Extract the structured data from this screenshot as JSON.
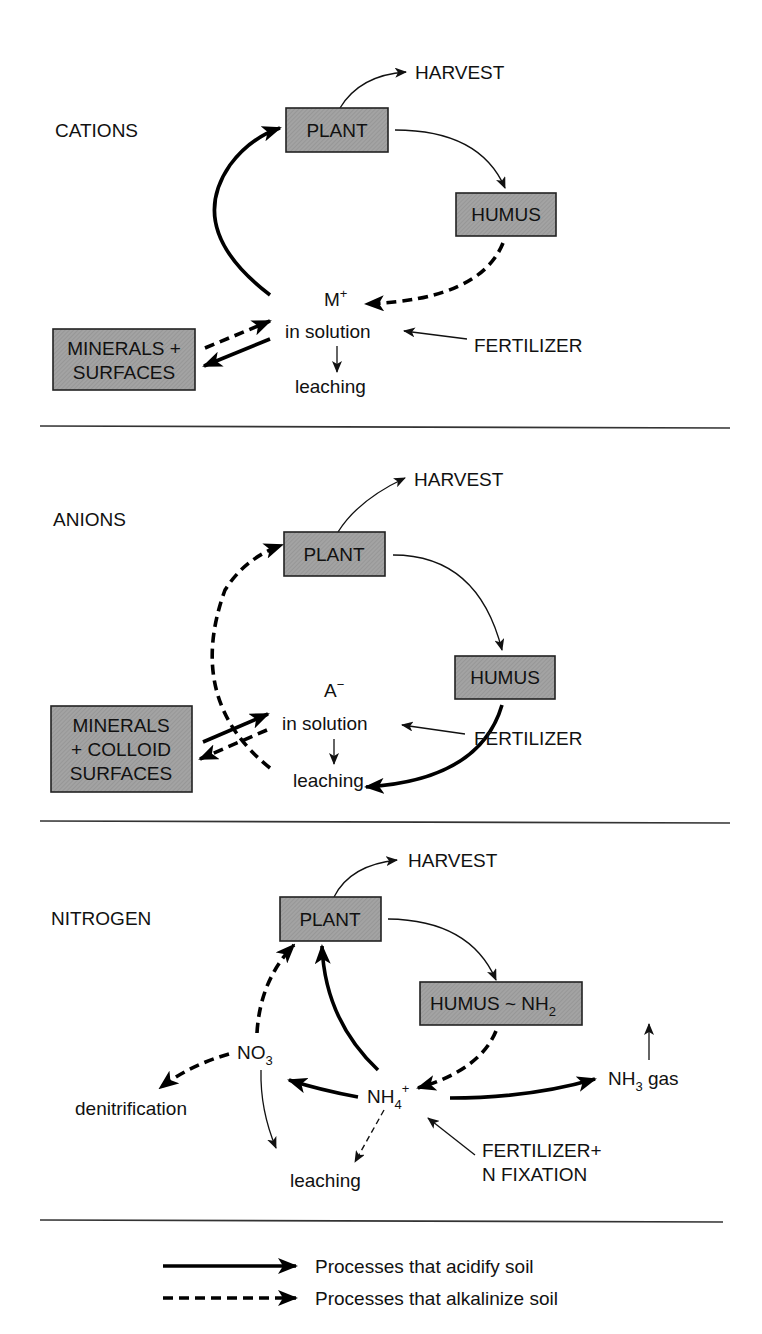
{
  "colors": {
    "box_fill": "#9a9a9a",
    "ink": "#111111",
    "background": "#ffffff"
  },
  "sections": {
    "cations": {
      "title": "CATIONS",
      "harvest": "HARVEST",
      "plant": "PLANT",
      "humus": "HUMUS",
      "ion": "M",
      "ion_charge": "+",
      "in_solution": "in solution",
      "fertilizer": "FERTILIZER",
      "leaching": "leaching",
      "minerals_line1": "MINERALS +",
      "minerals_line2": "SURFACES"
    },
    "anions": {
      "title": "ANIONS",
      "harvest": "HARVEST",
      "plant": "PLANT",
      "humus": "HUMUS",
      "ion": "A",
      "ion_charge": "−",
      "in_solution": "in solution",
      "fertilizer": "FERTILIZER",
      "leaching": "leaching",
      "minerals_line1": "MINERALS",
      "minerals_line2": "+ COLLOID",
      "minerals_line3": "SURFACES"
    },
    "nitrogen": {
      "title": "NITROGEN",
      "harvest": "HARVEST",
      "plant": "PLANT",
      "humus": "HUMUS ~ NH",
      "humus_sub": "2",
      "nitrate": "NO",
      "nitrate_sub": "3",
      "ammonium": "NH",
      "ammonium_sub": "4",
      "ammonium_charge": "+",
      "ammonia": "NH",
      "ammonia_sub": "3",
      "ammonia_suffix": " gas",
      "denitrification": "denitrification",
      "leaching": "leaching",
      "fertilizer_line1": "FERTILIZER+",
      "fertilizer_line2": "N FIXATION"
    }
  },
  "legend": {
    "solid": "Processes that acidify soil",
    "dashed": "Processes that alkalinize soil"
  }
}
